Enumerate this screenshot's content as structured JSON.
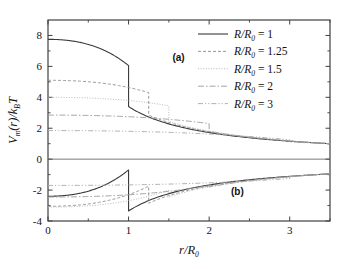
{
  "figure": {
    "background_color": "#ffffff",
    "frame_color": "#404040",
    "panel_labels": [
      {
        "text": "(a)",
        "x": 1.62,
        "y": 6.35
      },
      {
        "text": "(b)",
        "x": 2.35,
        "y": -2.35
      }
    ]
  },
  "chart_data": {
    "type": "line",
    "title": "",
    "xlabel": "r/R0",
    "xlabel_parts": {
      "main": "r/R",
      "sub": "0"
    },
    "ylabel": "Vm(r)/kBT",
    "ylabel_parts": {
      "v": "V",
      "v_sub": "m",
      "arg": "(r)/",
      "k": "k",
      "k_sub": "B",
      "t": "T"
    },
    "xlim": [
      0,
      3.5
    ],
    "ylim": [
      -4,
      9
    ],
    "xticks": [
      0,
      1,
      2,
      3
    ],
    "xtick_labels": [
      "0",
      "1",
      "2",
      "3"
    ],
    "xticks_minor": [
      0.5,
      1.5,
      2.5,
      3.5
    ],
    "yticks": [
      -4,
      -2,
      0,
      2,
      4,
      6,
      8
    ],
    "ytick_labels": [
      "-4",
      "-2",
      "0",
      "2",
      "4",
      "6",
      "8"
    ],
    "yticks_minor": [
      -3,
      -1,
      1,
      3,
      5,
      7
    ],
    "grid": false,
    "zero_line": true,
    "legend_position": "top-right",
    "legend_entries": [
      {
        "label": "R/R0 = 1",
        "label_parts": {
          "pre": "R/R",
          "sub": "0",
          "post": " = 1"
        },
        "R_over_R0": 1,
        "dash": "none",
        "color": "#3a3a3a",
        "width": 1.1
      },
      {
        "label": "R/R0 = 1.25",
        "label_parts": {
          "pre": "R/R",
          "sub": "0",
          "post": " = 1.25"
        },
        "R_over_R0": 1.25,
        "dash": "3,2",
        "color": "#8c8c8c",
        "width": 0.9
      },
      {
        "label": "R/R0 = 1.5",
        "label_parts": {
          "pre": "R/R",
          "sub": "0",
          "post": " = 1.5"
        },
        "R_over_R0": 1.5,
        "dash": "1,1.6",
        "color": "#b0b0b0",
        "width": 0.9
      },
      {
        "label": "R/R0 = 2",
        "label_parts": {
          "pre": "R/R",
          "sub": "0",
          "post": " = 2"
        },
        "R_over_R0": 2,
        "dash": "6,2,1.5,2",
        "color": "#9a9a9a",
        "width": 0.9
      },
      {
        "label": "R/R0 = 3",
        "label_parts": {
          "pre": "R/R",
          "sub": "0",
          "post": " = 3"
        },
        "R_over_R0": 3,
        "dash": "5,2,1.2,2,1.2,2",
        "color": "#a8a8a8",
        "width": 0.9
      }
    ],
    "panels": [
      {
        "name": "a",
        "sign": 1,
        "description": "Repulsive branch: potential starts positive at r=0, decays, drops discontinuously at r=R/R0, then follows common 1/r tail",
        "series": [
          {
            "name": "R/R0 = 1",
            "R_over_R0": 1,
            "y_at_r0": 7.75,
            "y_before_jump": 6.05,
            "y_after_jump": 3.4,
            "y_at_r_3_5": 1.0
          },
          {
            "name": "R/R0 = 1.25",
            "R_over_R0": 1.25,
            "y_at_r0": 5.1,
            "y_before_jump": 4.3,
            "y_after_jump": 2.85,
            "y_at_r_3_5": 1.0
          },
          {
            "name": "R/R0 = 1.5",
            "R_over_R0": 1.5,
            "y_at_r0": 4.0,
            "y_before_jump": 3.45,
            "y_after_jump": 2.45,
            "y_at_r_3_5": 1.0
          },
          {
            "name": "R/R0 = 2",
            "R_over_R0": 2,
            "y_at_r0": 2.85,
            "y_before_jump": 2.3,
            "y_after_jump": 1.8,
            "y_at_r_3_5": 1.0
          },
          {
            "name": "R/R0 = 3",
            "R_over_R0": 3,
            "y_at_r0": 1.85,
            "y_before_jump": 1.25,
            "y_after_jump": 1.12,
            "y_at_r_3_5": 1.0
          }
        ]
      },
      {
        "name": "b",
        "sign": -1,
        "description": "Attractive branch: mirror of panel (a) about V=0; rises from negative values toward zero, with discontinuous drop at r=R/R0",
        "series": [
          {
            "name": "R/R0 = 1",
            "R_over_R0": 1,
            "y_at_r0": -2.4,
            "y_before_jump": -0.7,
            "y_after_jump": -3.35,
            "y_at_r_3_5": -0.95
          },
          {
            "name": "R/R0 = 1.25",
            "R_over_R0": 1.25,
            "y_at_r0": -3.05,
            "y_before_jump": -1.75,
            "y_after_jump": -2.85,
            "y_at_r_3_5": -0.95
          },
          {
            "name": "R/R0 = 1.5",
            "R_over_R0": 1.5,
            "y_at_r0": -3.1,
            "y_before_jump": -2.0,
            "y_after_jump": -2.45,
            "y_at_r_3_5": -0.95
          },
          {
            "name": "R/R0 = 2",
            "R_over_R0": 2,
            "y_at_r0": -2.45,
            "y_before_jump": -1.7,
            "y_after_jump": -1.8,
            "y_at_r_3_5": -0.95
          },
          {
            "name": "R/R0 = 3",
            "R_over_R0": 3,
            "y_at_r0": -1.7,
            "y_before_jump": -1.25,
            "y_after_jump": -1.12,
            "y_at_r_3_5": -0.95
          }
        ]
      }
    ]
  }
}
